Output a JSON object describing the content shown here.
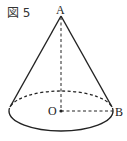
{
  "figure": {
    "label": "図 5",
    "points": {
      "apex": "A",
      "center": "O",
      "rim": "B"
    },
    "colors": {
      "stroke": "#222222",
      "background": "#ffffff"
    },
    "shape": "cone",
    "elements": [
      "solid slant edges from A to base",
      "dashed height AO",
      "dashed radius OB",
      "dashed back half of base ellipse",
      "solid front half of base ellipse",
      "dot at O"
    ]
  }
}
